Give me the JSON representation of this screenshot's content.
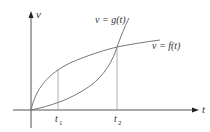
{
  "diagram": {
    "axes": {
      "y_label": "v",
      "x_label": "t"
    },
    "curves": [
      {
        "name": "g",
        "label": "v = g(t)",
        "shape": "convex, increasing"
      },
      {
        "name": "f",
        "label": "v = f(t)",
        "shape": "concave, increasing"
      }
    ],
    "ticks": [
      {
        "label": "t",
        "subscript": "1"
      },
      {
        "label": "t",
        "subscript": "2"
      }
    ],
    "colors": {
      "axis": "#555555",
      "curve": "#777777",
      "guide": "#999999",
      "text": "#333333"
    }
  }
}
